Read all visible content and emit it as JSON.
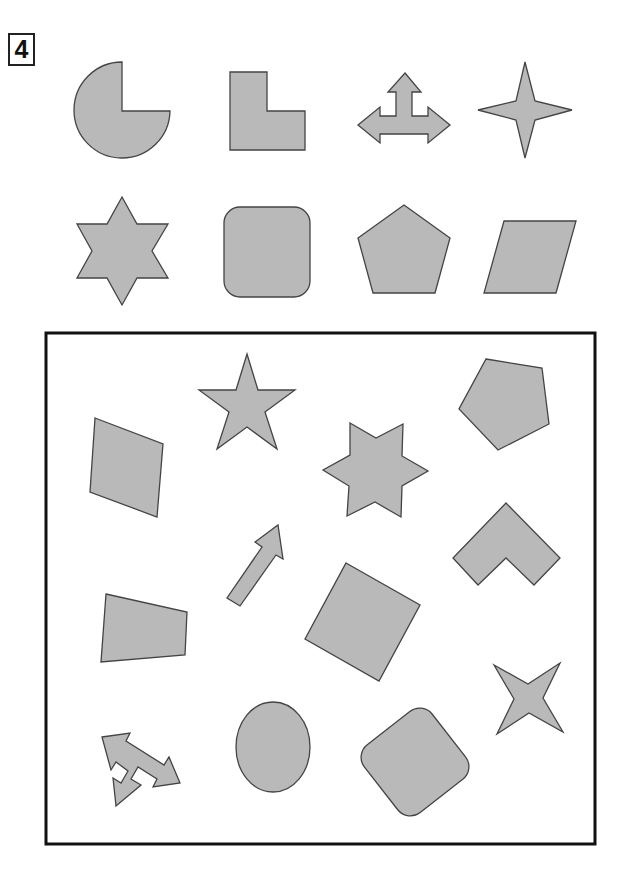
{
  "puzzle": {
    "number": "4",
    "colors": {
      "fill": "#b9b9b9",
      "stroke": "#444444",
      "frame": "#111111",
      "background": "#ffffff"
    },
    "reference_shapes": [
      {
        "row": 1,
        "col": 1,
        "shape": "three-quarter-circle"
      },
      {
        "row": 1,
        "col": 2,
        "shape": "l-shape"
      },
      {
        "row": 1,
        "col": 3,
        "shape": "three-way-arrow"
      },
      {
        "row": 1,
        "col": 4,
        "shape": "four-point-star"
      },
      {
        "row": 2,
        "col": 1,
        "shape": "six-point-star"
      },
      {
        "row": 2,
        "col": 2,
        "shape": "rounded-square"
      },
      {
        "row": 2,
        "col": 3,
        "shape": "pentagon"
      },
      {
        "row": 2,
        "col": 4,
        "shape": "parallelogram"
      }
    ],
    "scattered_shapes": [
      "five-point-star",
      "pentagon",
      "parallelogram",
      "six-point-star",
      "arrow",
      "chevron",
      "trapezoid",
      "rotated-square",
      "four-point-star",
      "three-way-arrow",
      "ellipse",
      "rounded-square"
    ]
  }
}
